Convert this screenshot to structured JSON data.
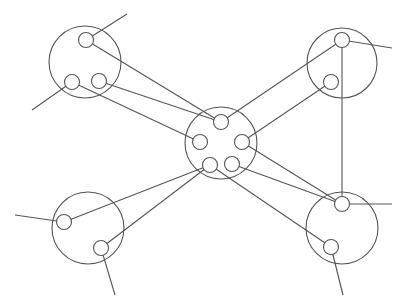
{
  "diagram": {
    "type": "network-topology",
    "stroke_color": "#555555",
    "background": "#ffffff",
    "clusters": [
      {
        "id": "top-left",
        "cx": 85,
        "cy": 62,
        "r": 36,
        "ports": [
          {
            "id": "tl-1",
            "cx": 86,
            "cy": 40
          },
          {
            "id": "tl-2",
            "cx": 72,
            "cy": 82
          },
          {
            "id": "tl-3",
            "cx": 99,
            "cy": 81
          }
        ]
      },
      {
        "id": "top-right",
        "cx": 342,
        "cy": 63,
        "r": 35,
        "ports": [
          {
            "id": "tr-1",
            "cx": 342,
            "cy": 40
          },
          {
            "id": "tr-2",
            "cx": 331,
            "cy": 82
          }
        ]
      },
      {
        "id": "center",
        "cx": 221,
        "cy": 143,
        "r": 36,
        "ports": [
          {
            "id": "c-1",
            "cx": 221,
            "cy": 122
          },
          {
            "id": "c-2",
            "cx": 200,
            "cy": 142
          },
          {
            "id": "c-3",
            "cx": 242,
            "cy": 142
          },
          {
            "id": "c-4",
            "cx": 210,
            "cy": 165
          },
          {
            "id": "c-5",
            "cx": 232,
            "cy": 164
          }
        ]
      },
      {
        "id": "bottom-left",
        "cx": 88,
        "cy": 228,
        "r": 36,
        "ports": [
          {
            "id": "bl-1",
            "cx": 64,
            "cy": 222
          },
          {
            "id": "bl-2",
            "cx": 101,
            "cy": 248
          }
        ]
      },
      {
        "id": "bottom-right",
        "cx": 342,
        "cy": 228,
        "r": 36,
        "ports": [
          {
            "id": "br-1",
            "cx": 342,
            "cy": 204
          },
          {
            "id": "br-2",
            "cx": 331,
            "cy": 247
          }
        ]
      }
    ],
    "port_radius": 7.5,
    "links": [
      {
        "x1": 86,
        "y1": 40,
        "x2": 221,
        "y2": 122
      },
      {
        "x1": 99,
        "y1": 81,
        "x2": 221,
        "y2": 122
      },
      {
        "x1": 72,
        "y1": 82,
        "x2": 200,
        "y2": 142
      },
      {
        "x1": 342,
        "y1": 40,
        "x2": 221,
        "y2": 122
      },
      {
        "x1": 331,
        "y1": 82,
        "x2": 242,
        "y2": 142
      },
      {
        "x1": 342,
        "y1": 40,
        "x2": 342,
        "y2": 204
      },
      {
        "x1": 242,
        "y1": 142,
        "x2": 342,
        "y2": 204
      },
      {
        "x1": 232,
        "y1": 164,
        "x2": 342,
        "y2": 204
      },
      {
        "x1": 210,
        "y1": 165,
        "x2": 331,
        "y2": 247
      },
      {
        "x1": 64,
        "y1": 222,
        "x2": 210,
        "y2": 165
      },
      {
        "x1": 101,
        "y1": 248,
        "x2": 210,
        "y2": 165
      }
    ],
    "stubs": [
      {
        "x1": 86,
        "y1": 40,
        "x2": 127,
        "y2": 14
      },
      {
        "x1": 72,
        "y1": 82,
        "x2": 32,
        "y2": 110
      },
      {
        "x1": 342,
        "y1": 40,
        "x2": 392,
        "y2": 48
      },
      {
        "x1": 64,
        "y1": 222,
        "x2": 15,
        "y2": 215
      },
      {
        "x1": 101,
        "y1": 248,
        "x2": 115,
        "y2": 295
      },
      {
        "x1": 342,
        "y1": 204,
        "x2": 392,
        "y2": 204
      },
      {
        "x1": 331,
        "y1": 247,
        "x2": 343,
        "y2": 295
      }
    ]
  }
}
